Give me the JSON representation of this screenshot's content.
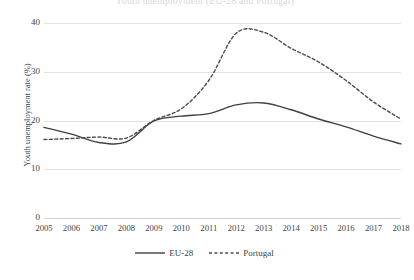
{
  "chart_data": {
    "type": "line",
    "title": "Youth unemployment (EU-28 and Portugal)",
    "xlabel": "",
    "ylabel": "Youth unemployment rate (%)",
    "x": [
      2005,
      2006,
      2007,
      2008,
      2009,
      2010,
      2011,
      2012,
      2013,
      2014,
      2015,
      2016,
      2017,
      2018
    ],
    "categories": [
      "2005",
      "2006",
      "2007",
      "2008",
      "2009",
      "2010",
      "2011",
      "2012",
      "2013",
      "2014",
      "2015",
      "2016",
      "2017",
      "2018"
    ],
    "xlim": [
      2005,
      2018
    ],
    "ylim": [
      0,
      40
    ],
    "yticks": [
      0,
      10,
      20,
      30,
      40
    ],
    "ytick_labels": [
      "0",
      "10",
      "20",
      "30",
      "40"
    ],
    "grid": true,
    "legend_position": "bottom",
    "series": [
      {
        "name": "EU-28",
        "style": "solid",
        "color": "#404040",
        "values": [
          18.6,
          17.2,
          15.5,
          15.6,
          19.9,
          20.9,
          21.4,
          23.2,
          23.6,
          22.2,
          20.3,
          18.7,
          16.8,
          15.2
        ]
      },
      {
        "name": "Portugal",
        "style": "dashed",
        "color": "#4a4a4a",
        "values": [
          16.1,
          16.3,
          16.6,
          16.4,
          20.0,
          22.4,
          28.2,
          37.9,
          38.1,
          34.8,
          32.0,
          28.2,
          23.8,
          20.3
        ]
      }
    ]
  },
  "legend": {
    "items": [
      {
        "label": "EU-28",
        "style": "solid"
      },
      {
        "label": "Portugal",
        "style": "dashed"
      }
    ]
  },
  "axes": {
    "y_title": "Youth unemployment rate (%)"
  }
}
